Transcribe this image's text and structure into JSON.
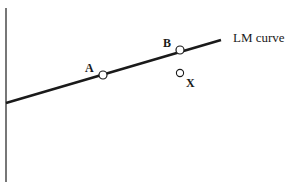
{
  "diagram": {
    "curve_label": "LM curve",
    "points": [
      {
        "label": "A",
        "x": 103,
        "y": 75
      },
      {
        "label": "B",
        "x": 180,
        "y": 50
      },
      {
        "label": "X",
        "x": 180,
        "y": 73
      }
    ],
    "colors": {
      "line": "#1a1a1a",
      "axis": "#555555",
      "marker_fill": "#ffffff"
    }
  }
}
